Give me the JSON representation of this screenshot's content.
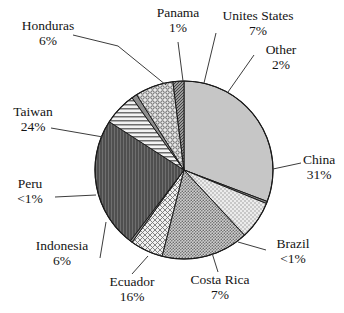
{
  "chart_data": {
    "type": "pie",
    "title": "",
    "subtitle": "",
    "xlabel": "",
    "ylabel": "",
    "legend_position": "none",
    "grid": false,
    "labels_show_percent": true,
    "slices": [
      {
        "name": "China",
        "percent_label": "31%",
        "value": 31,
        "fill": "#c4c4c4",
        "pattern": "solid-light-gray"
      },
      {
        "name": "Brazil",
        "percent_label": "<1%",
        "value": 0.4,
        "fill": "#9a9a9a",
        "pattern": "solid-gray"
      },
      {
        "name": "Costa Rica",
        "percent_label": "7%",
        "value": 7,
        "fill": "#e2e2e2",
        "pattern": "fine-stipple-light"
      },
      {
        "name": "Ecuador",
        "percent_label": "16%",
        "value": 16,
        "fill": "#bdbdbd",
        "pattern": "stipple-medium"
      },
      {
        "name": "Indonesia",
        "percent_label": "6%",
        "value": 6,
        "fill": "#dedede",
        "pattern": "diagonal-crosshatch"
      },
      {
        "name": "Peru",
        "percent_label": "<1%",
        "value": 0.4,
        "fill": "#8f8f8f",
        "pattern": "solid-gray"
      },
      {
        "name": "Taiwan",
        "percent_label": "24%",
        "value": 24,
        "fill": "#5e5e5e",
        "pattern": "vertical-lines-dark"
      },
      {
        "name": "Honduras",
        "percent_label": "6%",
        "value": 6,
        "fill": "#e6e6e6",
        "pattern": "horizontal-lines"
      },
      {
        "name": "Panama",
        "percent_label": "1%",
        "value": 1,
        "fill": "#707070",
        "pattern": "solid-gray"
      },
      {
        "name": "Unites States",
        "percent_label": "7%",
        "value": 7,
        "fill": "#dcdcdc",
        "pattern": "small-circles"
      },
      {
        "name": "Other",
        "percent_label": "2%",
        "value": 2,
        "fill": "#8a8a8a",
        "pattern": "fine-crosshatch-dark"
      }
    ]
  },
  "geometry": {
    "center_x": 184,
    "center_y": 170,
    "radius": 89,
    "start_angle_deg": -90,
    "direction": "clockwise"
  },
  "colors": {
    "background": "#ffffff",
    "outline": "#1a1a1a",
    "leader_line": "#3c3c3c",
    "text": "#141414"
  },
  "labels": {
    "honduras": {
      "name": "Honduras",
      "percent": "6%"
    },
    "panama": {
      "name": "Panama",
      "percent": "1%"
    },
    "united_states": {
      "name": "Unites States",
      "percent": "7%"
    },
    "other": {
      "name": "Other",
      "percent": "2%"
    },
    "china": {
      "name": "China",
      "percent": "31%"
    },
    "brazil": {
      "name": "Brazil",
      "percent": "<1%"
    },
    "costa_rica": {
      "name": "Costa Rica",
      "percent": "7%"
    },
    "ecuador": {
      "name": "Ecuador",
      "percent": "16%"
    },
    "indonesia": {
      "name": "Indonesia",
      "percent": "6%"
    },
    "peru": {
      "name": "Peru",
      "percent": "<1%"
    },
    "taiwan": {
      "name": "Taiwan",
      "percent": "24%"
    }
  }
}
